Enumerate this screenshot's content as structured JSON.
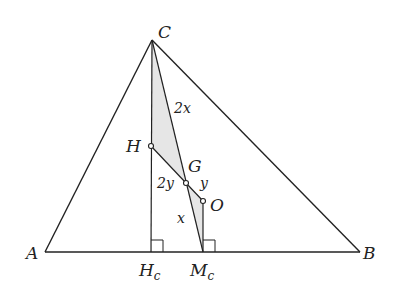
{
  "diagram": {
    "points": {
      "A": {
        "label": "A",
        "x": 45,
        "y": 252
      },
      "B": {
        "label": "B",
        "x": 360,
        "y": 252
      },
      "C": {
        "label": "C",
        "x": 152,
        "y": 40
      },
      "H": {
        "label": "H",
        "x": 151,
        "y": 146
      },
      "G": {
        "label": "G",
        "x": 186,
        "y": 183
      },
      "O": {
        "label": "O",
        "x": 203,
        "y": 201
      },
      "Hc": {
        "label": "H",
        "sub": "c",
        "x": 151,
        "y": 252
      },
      "Mc": {
        "label": "M",
        "sub": "c",
        "x": 203,
        "y": 252
      }
    },
    "segment_labels": {
      "CG": "2x",
      "GMc": "x",
      "HG": "2y",
      "GO": "y"
    },
    "colors": {
      "line": "#222222",
      "shade": "#e6e6e6"
    }
  }
}
